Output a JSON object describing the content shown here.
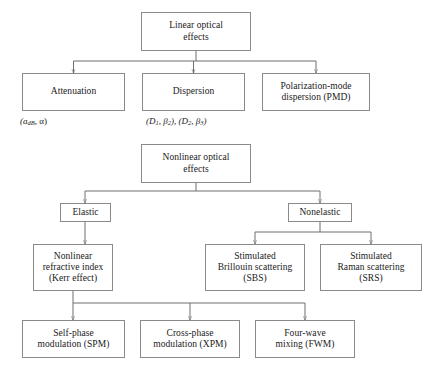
{
  "figure": {
    "line_color": "#6f6f6f",
    "box_border_color": "#8a8a8a",
    "text_color": "#1a1a1a",
    "background": "#ffffff"
  },
  "linear_tree": {
    "root": {
      "line1": "Linear optical",
      "line2": "effects"
    },
    "children": [
      {
        "line1": "Attenuation",
        "line2": "",
        "line3": "",
        "annotation_prefix": "(a",
        "annotation_sub": "dB",
        "annotation_suffix": ", α)"
      },
      {
        "line1": "Dispersion",
        "line2": "",
        "line3": "",
        "annotation_d1": "(D",
        "annotation_d1_sub": "1",
        "annotation_b2": ", β",
        "annotation_b2_sub": "2",
        "annotation_mid": "), (D",
        "annotation_d2_sub": "2",
        "annotation_b3": ", β",
        "annotation_b3_sub": "3",
        "annotation_end": ")"
      },
      {
        "line1": "Polarization-mode",
        "line2": "dispersion (PMD)",
        "line3": ""
      }
    ]
  },
  "nonlinear_tree": {
    "root": {
      "line1": "Nonlinear optical",
      "line2": "effects"
    },
    "branches": [
      {
        "label": "Elastic"
      },
      {
        "label": "Nonelastic"
      }
    ],
    "elastic_children": [
      {
        "line1": "Nonlinear",
        "line2": "refractive index",
        "line3": "(Kerr effect)"
      }
    ],
    "nonelastic_children": [
      {
        "line1": "Stimulated",
        "line2": "Brillouin scattering",
        "line3": "(SBS)"
      },
      {
        "line1": "Stimulated",
        "line2": "Raman scattering",
        "line3": "(SRS)"
      }
    ],
    "kerr_children": [
      {
        "line1": "Self-phase",
        "line2": "modulation (SPM)",
        "line3": ""
      },
      {
        "line1": "Cross-phase",
        "line2": "modulation (XPM)",
        "line3": ""
      },
      {
        "line1": "Four-wave",
        "line2": "mixing (FWM)",
        "line3": ""
      }
    ]
  }
}
